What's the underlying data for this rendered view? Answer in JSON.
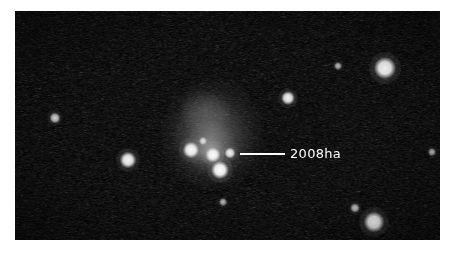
{
  "figure": {
    "width": 455,
    "height": 255,
    "page_background": "#ffffff",
    "kind": "astronomical-image"
  },
  "sky": {
    "frame": {
      "x": 15,
      "y": 11,
      "width": 425,
      "height": 229
    },
    "background_color": "#050505",
    "noise_color": "#3a3a3a",
    "description": "noisy dark sky background with stars and a diffuse galaxy"
  },
  "annotation": {
    "label": "2008ha",
    "label_color": "#ffffff",
    "label_x": 290,
    "label_y": 147,
    "font_size": 13,
    "leader_line": {
      "x1": 240,
      "y1": 154,
      "x2": 285,
      "y2": 154,
      "color": "#ffffff",
      "thickness": 1.6
    }
  },
  "galaxy": {
    "name": "host-galaxy",
    "center_x": 212,
    "center_y": 136,
    "halo_radius_x": 52,
    "halo_radius_y": 56,
    "halo_color": "#9a9a9a",
    "description": "diffuse low surface brightness irregular galaxy"
  },
  "halos": [
    {
      "name": "galaxy-outer-halo",
      "cx": 212,
      "cy": 134,
      "rx": 54,
      "ry": 58,
      "color": "rgba(150,150,150,0.30)"
    },
    {
      "name": "galaxy-mid-halo",
      "cx": 211,
      "cy": 138,
      "rx": 38,
      "ry": 40,
      "color": "rgba(170,170,170,0.34)"
    },
    {
      "name": "galaxy-inner-halo",
      "cx": 210,
      "cy": 145,
      "rx": 26,
      "ry": 25,
      "color": "rgba(190,190,190,0.40)"
    },
    {
      "name": "galaxy-upper-wisp",
      "cx": 205,
      "cy": 112,
      "rx": 26,
      "ry": 22,
      "color": "rgba(160,160,160,0.26)"
    },
    {
      "name": "galaxy-core-glow",
      "cx": 211,
      "cy": 152,
      "rx": 16,
      "ry": 13,
      "color": "rgba(210,210,210,0.45)"
    }
  ],
  "stars": [
    {
      "name": "star-bright-upper-right",
      "cx": 385,
      "cy": 68,
      "r": 5.0,
      "brightness": 1.0
    },
    {
      "name": "star-bright-lower-right",
      "cx": 374,
      "cy": 222,
      "r": 4.6,
      "brightness": 0.97
    },
    {
      "name": "star-mid-left",
      "cx": 128,
      "cy": 160,
      "r": 3.6,
      "brightness": 0.92
    },
    {
      "name": "star-upper-middle",
      "cx": 288,
      "cy": 98,
      "r": 3.2,
      "brightness": 0.88
    },
    {
      "name": "star-faint-left",
      "cx": 55,
      "cy": 118,
      "r": 2.6,
      "brightness": 0.62
    },
    {
      "name": "star-faint-lower-right",
      "cx": 355,
      "cy": 208,
      "r": 2.2,
      "brightness": 0.52
    },
    {
      "name": "star-faint-upper-right",
      "cx": 338,
      "cy": 66,
      "r": 1.8,
      "brightness": 0.38
    },
    {
      "name": "star-faint-bottom",
      "cx": 223,
      "cy": 202,
      "r": 1.8,
      "brightness": 0.36
    },
    {
      "name": "star-faint-far-right",
      "cx": 432,
      "cy": 152,
      "r": 1.8,
      "brightness": 0.42
    }
  ],
  "galaxy_knots": [
    {
      "name": "knot-left",
      "cx": 191,
      "cy": 150,
      "r": 3.6,
      "brightness": 0.95
    },
    {
      "name": "knot-center",
      "cx": 213,
      "cy": 155,
      "r": 3.4,
      "brightness": 0.93
    },
    {
      "name": "knot-supernova-2008ha",
      "cx": 230,
      "cy": 153,
      "r": 2.4,
      "brightness": 0.82
    },
    {
      "name": "knot-lower",
      "cx": 220,
      "cy": 170,
      "r": 4.0,
      "brightness": 0.99
    },
    {
      "name": "knot-inner-faint",
      "cx": 203,
      "cy": 141,
      "r": 2.0,
      "brightness": 0.6
    }
  ]
}
